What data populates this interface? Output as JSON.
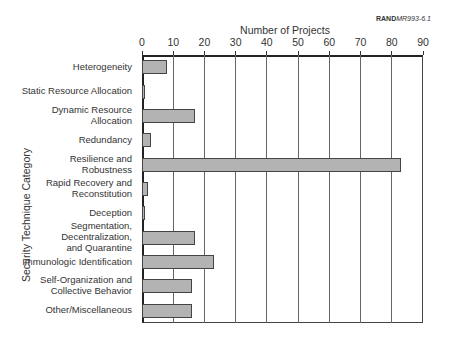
{
  "credit": {
    "org": "RAND",
    "ref": "MR993-6.1"
  },
  "chart_data": {
    "type": "bar",
    "orientation": "horizontal",
    "title": "",
    "xlabel": "Number of Projects",
    "ylabel": "Security Technique Category",
    "xlim": [
      0,
      90
    ],
    "xticks": [
      0,
      10,
      20,
      30,
      40,
      50,
      60,
      70,
      80,
      90
    ],
    "xtick_labels": [
      "0",
      "10",
      "20",
      "30",
      "40",
      "50",
      "60",
      "70",
      "80",
      "90"
    ],
    "xaxis_position": "top",
    "grid": "vertical",
    "legend": null,
    "categories": [
      "Heterogeneity",
      "Static Resource Allocation",
      "Dynamic Resource Allocation",
      "Redundancy",
      "Resilience and Robustness",
      "Rapid Recovery and Reconstitution",
      "Deception",
      "Segmentation, Decentralization, and Quarantine",
      "Immunologic Identification",
      "Self-Organization and Collective Behavior",
      "Other/Miscellaneous"
    ],
    "category_lines": [
      [
        "Heterogeneity"
      ],
      [
        "Static Resource Allocation"
      ],
      [
        "Dynamic Resource",
        "Allocation"
      ],
      [
        "Redundancy"
      ],
      [
        "Resilience and",
        "Robustness"
      ],
      [
        "Rapid Recovery and",
        "Reconstitution"
      ],
      [
        "Deception"
      ],
      [
        "Segmentation,",
        "Decentralization,",
        "and Quarantine"
      ],
      [
        "Immunologic Identification"
      ],
      [
        "Self-Organization and",
        "Collective Behavior"
      ],
      [
        "Other/Miscellaneous"
      ]
    ],
    "values": [
      8,
      1,
      17,
      3,
      83,
      2,
      1,
      17,
      23,
      16,
      16
    ],
    "bar_color": "#b3b3b3",
    "bar_edge_color": "#444444"
  }
}
